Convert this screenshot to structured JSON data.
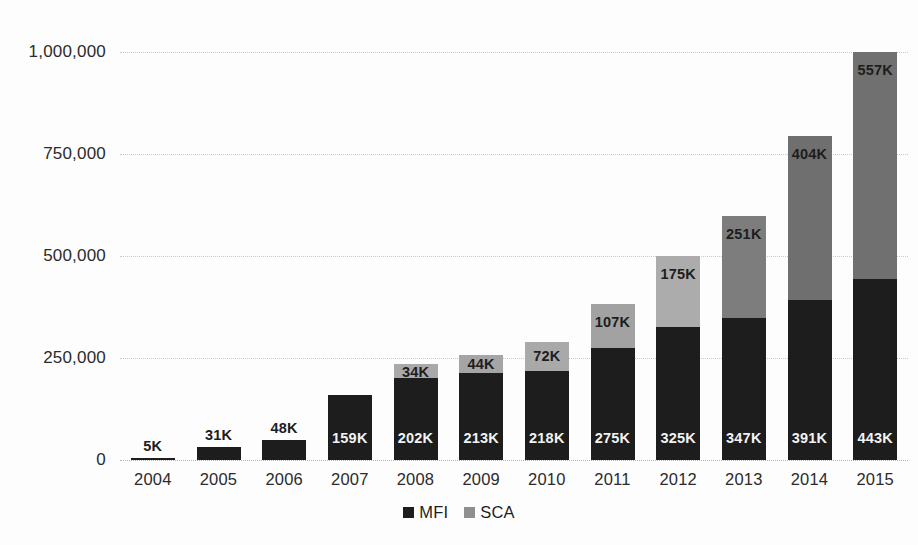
{
  "chart_data": {
    "type": "bar",
    "stacked": true,
    "title": "",
    "subtitle": "",
    "xlabel": "",
    "ylabel": "",
    "ylim": [
      0,
      1000000
    ],
    "grid": true,
    "legend_position": "bottom-center",
    "categories": [
      "2004",
      "2005",
      "2006",
      "2007",
      "2008",
      "2009",
      "2010",
      "2011",
      "2012",
      "2013",
      "2014",
      "2015"
    ],
    "ytick_labels": [
      "0",
      "250,000",
      "500,000",
      "750,000",
      "1,000,000"
    ],
    "ytick_values": [
      0,
      250000,
      500000,
      750000,
      1000000
    ],
    "series": [
      {
        "name": "MFI",
        "color": "#1d1d1d",
        "values": [
          5000,
          31000,
          48000,
          159000,
          202000,
          213000,
          218000,
          275000,
          325000,
          347000,
          391000,
          443000
        ],
        "data_labels": [
          "5K",
          "31K",
          "48K",
          "159K",
          "202K",
          "213K",
          "218K",
          "275K",
          "325K",
          "347K",
          "391K",
          "443K"
        ]
      },
      {
        "name": "SCA",
        "color": "#7b7b7b",
        "values": [
          0,
          0,
          0,
          0,
          34000,
          44000,
          72000,
          107000,
          175000,
          251000,
          404000,
          557000
        ],
        "data_labels": [
          "",
          "",
          "",
          "",
          "34K",
          "44K",
          "72K",
          "107K",
          "175K",
          "251K",
          "404K",
          "557K"
        ],
        "segment_colors": [
          "#7b7b7b",
          "#7b7b7b",
          "#7b7b7b",
          "#7b7b7b",
          "#a9a9a9",
          "#a5a5a5",
          "#a9a9a9",
          "#a2a2a2",
          "#acacac",
          "#7d7d7d",
          "#6f6f6f",
          "#707070"
        ]
      }
    ],
    "totals": [
      5000,
      31000,
      48000,
      159000,
      236000,
      257000,
      290000,
      382000,
      500000,
      598000,
      795000,
      1000000
    ]
  },
  "legend": {
    "items": [
      {
        "label": "MFI",
        "color": "#1d1d1d"
      },
      {
        "label": "SCA",
        "color": "#8f8f8f"
      }
    ]
  },
  "colors": {
    "mfi": "#1d1d1d",
    "sca": "#7b7b7b",
    "gridline": "#c9c9c9",
    "axis_text": "#2b2b2b",
    "background": "#fdfdfd"
  }
}
